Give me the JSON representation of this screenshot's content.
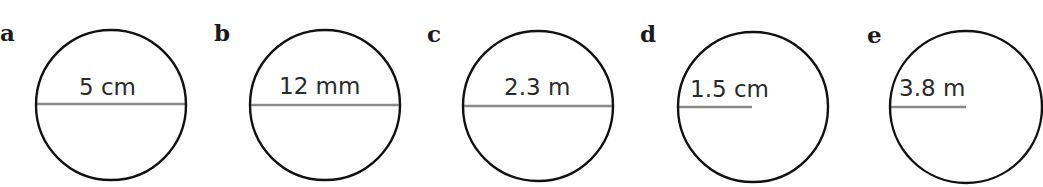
{
  "figure": {
    "colors": {
      "circle_stroke": "#111111",
      "measure_line": "#8a8a8a",
      "text": "#2a2a2a",
      "background": "#ffffff"
    },
    "items": [
      {
        "label": "a",
        "measure_type": "diameter",
        "value_text": "5 cm",
        "label_pos": [
          0,
          41
        ],
        "circle": {
          "cx": 111,
          "cy": 105,
          "r": 75
        },
        "line": {
          "x1": 36,
          "y1": 104,
          "x2": 186,
          "y2": 104
        },
        "text_pos": [
          79,
          95
        ]
      },
      {
        "label": "b",
        "measure_type": "diameter",
        "value_text": "12 mm",
        "label_pos": [
          214,
          41
        ],
        "circle": {
          "cx": 325,
          "cy": 105,
          "r": 75
        },
        "line": {
          "x1": 250,
          "y1": 105,
          "x2": 400,
          "y2": 105
        },
        "text_pos": [
          279,
          94
        ]
      },
      {
        "label": "c",
        "measure_type": "diameter",
        "value_text": "2.3 m",
        "label_pos": [
          427,
          42
        ],
        "circle": {
          "cx": 538,
          "cy": 106,
          "r": 75
        },
        "line": {
          "x1": 463,
          "y1": 106,
          "x2": 613,
          "y2": 106
        },
        "text_pos": [
          504,
          95
        ]
      },
      {
        "label": "d",
        "measure_type": "radius",
        "value_text": "1.5 cm",
        "label_pos": [
          640,
          42
        ],
        "circle": {
          "cx": 753,
          "cy": 107,
          "r": 75
        },
        "line": {
          "x1": 678,
          "y1": 107,
          "x2": 752,
          "y2": 107
        },
        "text_pos": [
          690,
          97
        ]
      },
      {
        "label": "e",
        "measure_type": "radius",
        "value_text": "3.8 m",
        "label_pos": [
          867,
          43
        ],
        "circle": {
          "cx": 966,
          "cy": 107,
          "r": 76
        },
        "line": {
          "x1": 890,
          "y1": 107,
          "x2": 966,
          "y2": 107
        },
        "text_pos": [
          899,
          96
        ]
      }
    ]
  }
}
